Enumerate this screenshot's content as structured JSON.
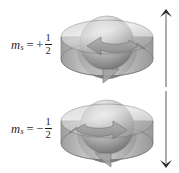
{
  "figure": {
    "background_color": "#ffffff",
    "rows": [
      {
        "id": "spin-up",
        "label": {
          "symbol": "m",
          "subscript": "s",
          "equals": "=",
          "sign": "+",
          "numerator": "1",
          "denominator": "2",
          "plain": "m_s = +1/2"
        },
        "spinner": {
          "name": "spinning-disc-counterclockwise",
          "rotation": "counterclockwise",
          "description": "Sphere inside a translucent disc with a curved rotation arrow"
        },
        "moment_arrow": {
          "name": "magnetic-moment-arrow-up",
          "direction": "up"
        }
      },
      {
        "id": "spin-down",
        "label": {
          "symbol": "m",
          "subscript": "s",
          "equals": "=",
          "sign": "−",
          "numerator": "1",
          "denominator": "2",
          "plain": "m_s = -1/2"
        },
        "spinner": {
          "name": "spinning-disc-clockwise",
          "rotation": "clockwise",
          "description": "Sphere inside a translucent disc with a curved rotation arrow"
        },
        "moment_arrow": {
          "name": "magnetic-moment-arrow-down",
          "direction": "down"
        }
      }
    ],
    "colors": {
      "disc_top_light": "#d8d8d8",
      "disc_top_mid": "#a9a9a9",
      "disc_side": "#8f8f8f",
      "sphere_highlight": "#f2f2f2",
      "sphere_mid": "#b4b4b4",
      "sphere_shadow": "#6f6f6f",
      "arrow_fill": "#9a9a9a",
      "outline": "#5a5a5a",
      "moment_arrow": "#3a3a3a",
      "text": "#1f1f1f"
    }
  }
}
